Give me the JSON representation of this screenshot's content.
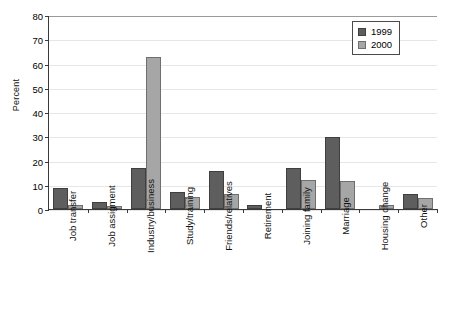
{
  "chart_data": {
    "type": "bar",
    "title": "",
    "xlabel": "",
    "ylabel": "Percent",
    "ylim": [
      0,
      80
    ],
    "ytick_step": 10,
    "yticks": [
      "0",
      "10",
      "20",
      "30",
      "40",
      "50",
      "60",
      "70",
      "80"
    ],
    "grid": true,
    "legend_position": "top-right",
    "categories": [
      "Job transfer",
      "Job assigment",
      "Industry/business",
      "Study/training",
      "Friends/relatives",
      "Retirement",
      "Joining family",
      "Marriage",
      "Housing change",
      "Other"
    ],
    "series": [
      {
        "name": "1999",
        "color": "#5e5e5e",
        "values": [
          8.8,
          3.0,
          17.0,
          7.0,
          15.5,
          1.5,
          16.8,
          29.8,
          0,
          6.0
        ]
      },
      {
        "name": "2000",
        "color": "#a6a6a6",
        "values": [
          1.7,
          1.2,
          62.5,
          5.0,
          6.0,
          0,
          12.0,
          11.7,
          1.8,
          4.5
        ]
      }
    ]
  },
  "legend": {
    "items": [
      {
        "label": "1999",
        "series_class": "series-1999"
      },
      {
        "label": "2000",
        "series_class": "series-2000"
      }
    ]
  }
}
